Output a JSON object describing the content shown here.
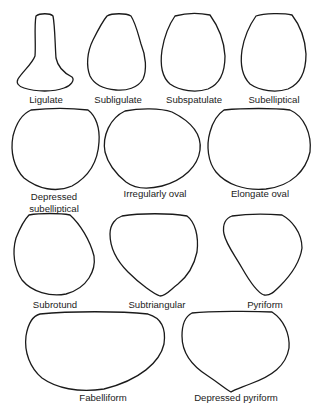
{
  "figure": {
    "shapes": [
      {
        "id": "ligulate",
        "label": "Ligulate"
      },
      {
        "id": "subligulate",
        "label": "Subligulate"
      },
      {
        "id": "subspatulate",
        "label": "Subspatulate"
      },
      {
        "id": "subelliptical",
        "label": "Subelliptical"
      },
      {
        "id": "depressed-subelliptical",
        "label_line1": "Depressed",
        "label_line2": "subelliptical"
      },
      {
        "id": "irregularly-oval",
        "label": "Irregularly oval"
      },
      {
        "id": "elongate-oval",
        "label": "Elongate oval"
      },
      {
        "id": "subrotund",
        "label": "Subrotund"
      },
      {
        "id": "subtriangular",
        "label": "Subtriangular"
      },
      {
        "id": "pyriform",
        "label": "Pyriform"
      },
      {
        "id": "fabelliform",
        "label": "Fabelliform"
      },
      {
        "id": "depressed-pyriform",
        "label": "Depressed pyriform"
      }
    ]
  },
  "colors": {
    "outline": "#1a1a1a",
    "text": "#222222",
    "background": "#ffffff"
  }
}
